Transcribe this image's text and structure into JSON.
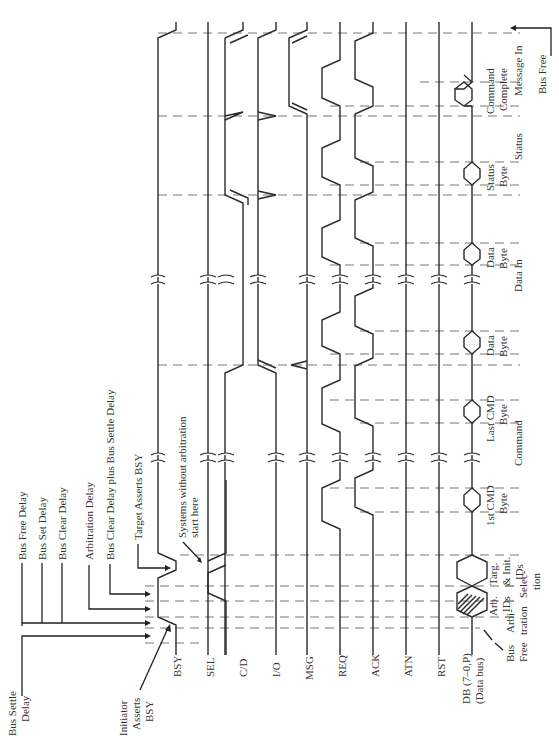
{
  "diagram": {
    "orientation": "rotated 90° counter-clockwise (time runs bottom to top)"
  },
  "signals": [
    {
      "id": "bsy",
      "label": "BSY"
    },
    {
      "id": "sel",
      "label": "SEL"
    },
    {
      "id": "cd",
      "label": "C/D"
    },
    {
      "id": "io",
      "label": "I/O"
    },
    {
      "id": "msg",
      "label": "MSG"
    },
    {
      "id": "req",
      "label": "REQ"
    },
    {
      "id": "ack",
      "label": "ACK"
    },
    {
      "id": "atn",
      "label": "ATN"
    },
    {
      "id": "rst",
      "label": "RST"
    },
    {
      "id": "db",
      "label": "DB (7–0,P)",
      "sublabel": "(Data bus)"
    }
  ],
  "delay_annotations": [
    {
      "label": "Bus Settle",
      "label2": "Delay"
    },
    {
      "label": "Bus Free Delay"
    },
    {
      "label": "Bus Set Delay"
    },
    {
      "label": "Bus Clear Delay"
    },
    {
      "label": "Arbitration Delay"
    },
    {
      "label": "Bus Clear Delay plus Bus Settle Delay"
    },
    {
      "label": "Target Asserts BSY"
    }
  ],
  "event_annotations": {
    "initiator": {
      "line1": "Initiator",
      "line2": "Asserts",
      "line3": "BSY"
    },
    "no_arbitration": {
      "line1": "Systems without arbitration",
      "line2": "start here"
    }
  },
  "data_bytes": [
    {
      "line1": "Arb.",
      "line2": "IDs"
    },
    {
      "line1": "Targ.",
      "line2": "& Init.",
      "line3": "IDs"
    },
    {
      "line1": "1st CMD",
      "line2": "Byte"
    },
    {
      "line1": "Last CMD",
      "line2": "Byte"
    },
    {
      "line1": "Data",
      "line2": "Byte"
    },
    {
      "line1": "Data",
      "line2": "Byte"
    },
    {
      "line1": "Status",
      "line2": "Byte"
    },
    {
      "line1": "Command",
      "line2": "Complete"
    }
  ],
  "phases": [
    {
      "line1": "Bus",
      "line2": "Free"
    },
    {
      "line1": "Arbi-",
      "line2": "tration"
    },
    {
      "line1": "Selec-",
      "line2": "tion"
    },
    {
      "line1": "Command"
    },
    {
      "line1": "Data In"
    },
    {
      "line1": "Status"
    },
    {
      "line1": "Message In"
    },
    {
      "line1": "Bus Free"
    }
  ]
}
